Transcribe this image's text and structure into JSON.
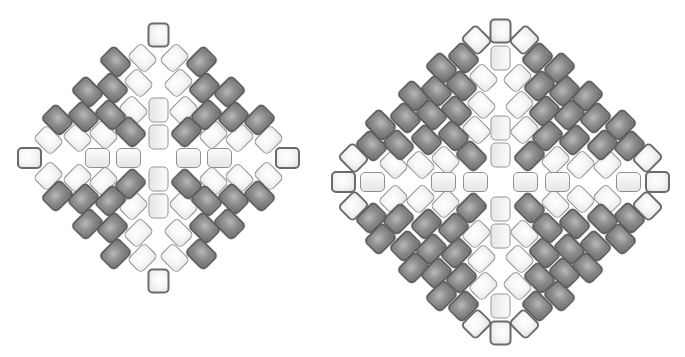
{
  "figure": {
    "colors": {
      "light_bead": "#f2f2f2",
      "dark_bead": "#8e8e8e",
      "outline": "#6a6a6a",
      "background": "#ffffff"
    },
    "diagrams": [
      {
        "name": "small-diamond",
        "center": [
          158,
          158
        ],
        "quadrant_beads": {
          "dark_tilted": [
            [
              -43,
              -96
            ],
            [
              -71,
              -66
            ],
            [
              -46,
              -70
            ],
            [
              -101,
              -38
            ],
            [
              -75,
              -41
            ],
            [
              -48,
              -43
            ],
            [
              -28,
              -26
            ]
          ],
          "white_tilted": [
            [
              -16,
              -100
            ],
            [
              -20,
              -75
            ],
            [
              -25,
              -48
            ],
            [
              -110,
              -18
            ],
            [
              -81,
              -20
            ],
            [
              -55,
              -23
            ]
          ],
          "outlined_tilted": []
        },
        "axis_beads": {
          "vertical": [
            [
              0,
              -48
            ],
            [
              0,
              -21
            ]
          ],
          "horizontal": [
            [
              -61,
              0
            ],
            [
              -30,
              0
            ]
          ],
          "vertical_outlined": [
            [
              0,
              -123
            ]
          ],
          "horizontal_outlined": [
            [
              -129,
              0
            ]
          ]
        }
      },
      {
        "name": "large-diamond",
        "center": [
          500,
          182
        ],
        "quadrant_beads": {
          "dark_tilted": [
            [
              -59,
              -114
            ],
            [
              -87,
              -86
            ],
            [
              -120,
              -57
            ],
            [
              -37,
              -124
            ],
            [
              -39,
              -96
            ],
            [
              -64,
              -91
            ],
            [
              -95,
              -64
            ],
            [
              -69,
              -67
            ],
            [
              -44,
              -71
            ],
            [
              -129,
              -36
            ],
            [
              -102,
              -37
            ],
            [
              -74,
              -42
            ],
            [
              -47,
              -46
            ],
            [
              -29,
              -26
            ]
          ],
          "white_tilted": [
            [
              -17,
              -104
            ],
            [
              -19,
              -77
            ],
            [
              -24,
              -52
            ],
            [
              -107,
              -17
            ],
            [
              -80,
              -17
            ],
            [
              -55,
              -22
            ]
          ],
          "outlined_tilted": [
            [
              -24,
              -142
            ],
            [
              -147,
              -24
            ]
          ]
        },
        "axis_beads": {
          "vertical": [
            [
              0,
              -124
            ],
            [
              0,
              -54
            ],
            [
              0,
              -27
            ]
          ],
          "horizontal": [
            [
              -128,
              0
            ],
            [
              -57,
              0
            ],
            [
              -25,
              0
            ]
          ],
          "vertical_outlined": [
            [
              0,
              -151
            ]
          ],
          "horizontal_outlined": [
            [
              -157,
              0
            ]
          ]
        }
      }
    ]
  }
}
